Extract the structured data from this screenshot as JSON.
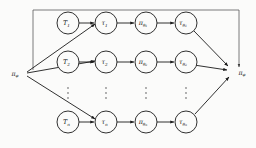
{
  "figure": {
    "name": "meta-policy-adaptation-graph",
    "type": "directed-graph",
    "background_color": "#fbfbfa",
    "stroke_color": "#1a1a1a",
    "loop_color": "#5a5a5a"
  },
  "nodes": {
    "source_policy": {
      "label": "π",
      "subscript": "φ",
      "full": "πφ",
      "role": "initial-meta-policy"
    },
    "target_policy": {
      "label": "π",
      "subscript": "φ",
      "full": "πφ",
      "role": "updated-meta-policy"
    }
  },
  "rows": [
    {
      "index": "1",
      "task": {
        "label": "T",
        "subscript": "1"
      },
      "trajectory": {
        "label": "τ",
        "subscript": "1"
      },
      "adapted_policy": {
        "label": "π",
        "subscript": "θ",
        "subscript2": "1"
      },
      "adapted_trajectory": {
        "label": "τ",
        "subscript": "θ",
        "subscript2": "1"
      }
    },
    {
      "index": "2",
      "task": {
        "label": "T",
        "subscript": "2"
      },
      "trajectory": {
        "label": "τ",
        "subscript": "2"
      },
      "adapted_policy": {
        "label": "π",
        "subscript": "θ",
        "subscript2": "2"
      },
      "adapted_trajectory": {
        "label": "τ",
        "subscript": "θ",
        "subscript2": "2"
      }
    },
    {
      "index": "n",
      "task": {
        "label": "T",
        "subscript": "n"
      },
      "trajectory": {
        "label": "τ",
        "subscript": "n"
      },
      "adapted_policy": {
        "label": "π",
        "subscript": "θ",
        "subscript2": "n"
      },
      "adapted_trajectory": {
        "label": "τ",
        "subscript": "θ",
        "subscript2": "n"
      }
    }
  ],
  "ellipsis": {
    "glyph": "⋮",
    "columns": [
      "task-column",
      "trajectory-column",
      "adapted-policy-column",
      "adapted-trajectory-column"
    ]
  },
  "columns": {
    "task": "T",
    "trajectory": "τ",
    "adapted_policy": "πθ",
    "adapted_trajectory": "τθ"
  }
}
